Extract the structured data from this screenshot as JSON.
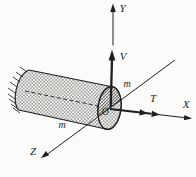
{
  "figure": {
    "kind": "cantilever-bar-cross-section-diagram",
    "labels": {
      "axis_y": "Y",
      "axis_x": "X",
      "axis_z": "Z",
      "shear_force": "V",
      "torque": "T",
      "origin": "O",
      "section_mark_upper": "m",
      "section_mark_lower": "m"
    },
    "colors": {
      "ink": "#1f1f1f",
      "paper": "#fbfbf9",
      "hatch": "#6b6b68",
      "face_hatch": "#3a3a38"
    }
  }
}
